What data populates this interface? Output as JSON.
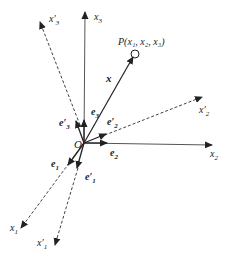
{
  "diagram": {
    "origin": {
      "label": "O",
      "x": 84,
      "y": 143
    },
    "point": {
      "label": "P(x₁, x₂, x₃)",
      "x": 135,
      "y": 54
    },
    "position_vector": {
      "label": "x"
    },
    "original_axes": [
      {
        "id": "x1",
        "label": "x",
        "sub": "1",
        "tip": [
          21,
          228
        ],
        "style": "dashed"
      },
      {
        "id": "x2",
        "label": "x",
        "sub": "2",
        "tip": [
          212,
          145
        ],
        "style": "solid"
      },
      {
        "id": "x3",
        "label": "x",
        "sub": "3",
        "tip": [
          85,
          12
        ],
        "style": "solid"
      }
    ],
    "rotated_axes": [
      {
        "id": "x1p",
        "label": "x′",
        "sub": "1",
        "tip": [
          55,
          245
        ],
        "style": "dashed"
      },
      {
        "id": "x2p",
        "label": "x′",
        "sub": "2",
        "tip": [
          202,
          97
        ],
        "style": "dashed"
      },
      {
        "id": "x3p",
        "label": "x′",
        "sub": "3",
        "tip": [
          40,
          22
        ],
        "style": "dashed"
      }
    ],
    "basis_vectors": [
      {
        "id": "e1",
        "label": "e",
        "sub": "1"
      },
      {
        "id": "e2",
        "label": "e",
        "sub": "2"
      },
      {
        "id": "e3",
        "label": "e",
        "sub": "3"
      },
      {
        "id": "e1p",
        "label": "e′",
        "sub": "1"
      },
      {
        "id": "e2p",
        "label": "e′",
        "sub": "2"
      },
      {
        "id": "e3p",
        "label": "e′",
        "sub": "3"
      }
    ],
    "colors": {
      "line": "#222222",
      "axis": "#555555"
    }
  }
}
